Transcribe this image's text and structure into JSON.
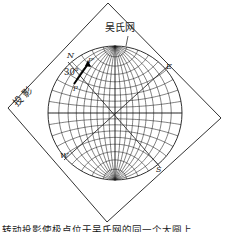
{
  "diagram": {
    "title_label": "吴氏网",
    "projection_label": "投 影",
    "directions": {
      "north": "N",
      "east": "E",
      "south": "S",
      "west": "W"
    },
    "angle_label": "30°",
    "point_labels": {
      "p_prime": "P'",
      "p": "P"
    },
    "grid": {
      "type": "Wulff net",
      "great_circle_step_deg": 10,
      "small_circle_step_deg": 10
    },
    "colors": {
      "line": "#1a1a1a",
      "background": "#ffffff"
    }
  },
  "caption": "转动投影使极点位于吴氏网的同一个大圆上"
}
